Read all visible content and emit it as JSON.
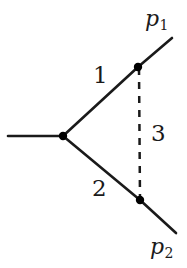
{
  "diagram": {
    "type": "feynman-diagram",
    "canvas": {
      "width": 187,
      "height": 268,
      "background": "#ffffff"
    },
    "colors": {
      "line": "#1a1a1a",
      "vertex": "#000000",
      "text": "#1a1a1a",
      "background": "#ffffff"
    },
    "labels": {
      "line_1": "1",
      "line_2": "2",
      "line_3": "3",
      "momentum_1": "p",
      "momentum_1_sub": "1",
      "momentum_2": "p",
      "momentum_2_sub": "2"
    },
    "vertices": [
      {
        "name": "center-vertex",
        "x": 63,
        "y": 136,
        "r": 4.2
      },
      {
        "name": "upper-vertex",
        "x": 138,
        "y": 67,
        "r": 4.2
      },
      {
        "name": "lower-vertex",
        "x": 140,
        "y": 200,
        "r": 4.2
      }
    ],
    "edges": [
      {
        "name": "incoming-line",
        "style": "solid",
        "x1": 8,
        "y1": 136,
        "x2": 63,
        "y2": 136
      },
      {
        "name": "propagator-line-1",
        "style": "solid",
        "x1": 63,
        "y1": 136,
        "x2": 138,
        "y2": 67
      },
      {
        "name": "propagator-line-2",
        "style": "solid",
        "x1": 63,
        "y1": 136,
        "x2": 140,
        "y2": 200
      },
      {
        "name": "outgoing-line-p1",
        "style": "solid",
        "x1": 138,
        "y1": 67,
        "x2": 172,
        "y2": 38
      },
      {
        "name": "outgoing-line-p2",
        "style": "solid",
        "x1": 140,
        "y1": 200,
        "x2": 176,
        "y2": 233
      },
      {
        "name": "propagator-line-3",
        "style": "dashed",
        "x1": 139,
        "y1": 68,
        "x2": 140,
        "y2": 199
      }
    ]
  }
}
